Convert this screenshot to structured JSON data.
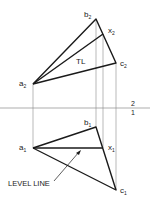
{
  "diagram": {
    "type": "descriptive-geometry-true-length",
    "folding_line": {
      "label_above": "2",
      "label_below": "1"
    },
    "top_view": {
      "points": {
        "a": {
          "label": "a",
          "sub": "2",
          "x": 33,
          "y": 84
        },
        "b": {
          "label": "b",
          "sub": "2",
          "x": 96,
          "y": 19
        },
        "x": {
          "label": "x",
          "sub": "2",
          "x": 103,
          "y": 34
        },
        "c": {
          "label": "c",
          "sub": "2",
          "x": 116,
          "y": 63
        }
      },
      "annotation": "TL"
    },
    "bottom_view": {
      "points": {
        "a": {
          "label": "a",
          "sub": "1",
          "x": 33,
          "y": 148
        },
        "b": {
          "label": "b",
          "sub": "1",
          "x": 96,
          "y": 127
        },
        "x": {
          "label": "x",
          "sub": "1",
          "x": 103,
          "y": 148
        },
        "c": {
          "label": "c",
          "sub": "1",
          "x": 116,
          "y": 190
        }
      },
      "annotation": "LEVEL LINE"
    },
    "colors": {
      "line": "#1a1a1a",
      "projector": "#888888"
    }
  }
}
